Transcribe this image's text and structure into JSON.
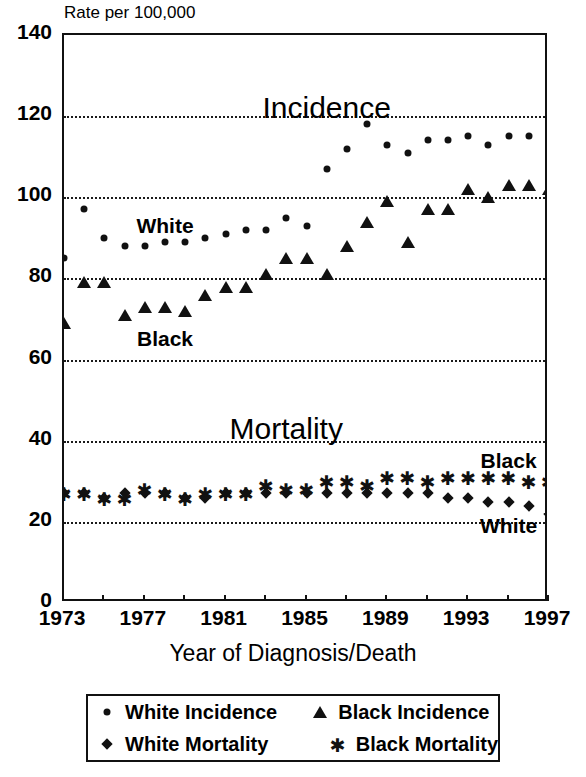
{
  "chart_data": {
    "type": "scatter",
    "title": "",
    "ylabel": "Rate per 100,000",
    "xlabel": "Year of Diagnosis/Death",
    "ylim": [
      0,
      140
    ],
    "xlim": [
      1973,
      1997
    ],
    "ytick_step": 20,
    "xtick_step": 4,
    "grid": true,
    "grid_axis": "y",
    "yticks": [
      "0",
      "20",
      "40",
      "60",
      "80",
      "100",
      "120",
      "140"
    ],
    "xticks": [
      "1973",
      "1977",
      "1981",
      "1985",
      "1989",
      "1993",
      "1997"
    ],
    "x": [
      1973,
      1974,
      1975,
      1976,
      1977,
      1978,
      1979,
      1980,
      1981,
      1982,
      1983,
      1984,
      1985,
      1986,
      1987,
      1988,
      1989,
      1990,
      1991,
      1992,
      1993,
      1994,
      1995,
      1996,
      1997
    ],
    "series": [
      {
        "name": "White Incidence",
        "marker": "dot",
        "values": [
          85,
          97,
          90,
          88,
          88,
          89,
          89,
          90,
          91,
          92,
          92,
          95,
          93,
          107,
          112,
          118,
          113,
          111,
          114,
          114,
          115,
          113,
          115,
          115,
          118
        ]
      },
      {
        "name": "Black Incidence",
        "marker": "triangle",
        "values": [
          69,
          79,
          79,
          71,
          73,
          73,
          72,
          76,
          78,
          78,
          81,
          85,
          85,
          81,
          88,
          94,
          99,
          89,
          97,
          97,
          102,
          100,
          103,
          103,
          102
        ]
      },
      {
        "name": "White Mortality",
        "marker": "diamond",
        "values": [
          27,
          27,
          26,
          27,
          27,
          27,
          26,
          26,
          27,
          27,
          27,
          27,
          27,
          27,
          27,
          27,
          27,
          27,
          27,
          26,
          26,
          25,
          25,
          24,
          22
        ]
      },
      {
        "name": "Black Mortality",
        "marker": "asterisk",
        "values": [
          27,
          27,
          26,
          26,
          28,
          27,
          26,
          27,
          27,
          27,
          29,
          28,
          28,
          30,
          30,
          29,
          31,
          31,
          30,
          31,
          31,
          31,
          31,
          30,
          30
        ]
      }
    ],
    "annotations": [
      {
        "text": "Incidence",
        "x": 1986,
        "y": 122,
        "size": "big"
      },
      {
        "text": "Mortality",
        "x": 1984,
        "y": 43,
        "size": "big"
      },
      {
        "text": "White",
        "x": 1978,
        "y": 93,
        "size": "med"
      },
      {
        "text": "Black",
        "x": 1978,
        "y": 65,
        "size": "med"
      },
      {
        "text": "Black",
        "x": 1995,
        "y": 35,
        "size": "med"
      },
      {
        "text": "White",
        "x": 1995,
        "y": 19,
        "size": "med"
      }
    ]
  },
  "legend": {
    "position": "below-plot",
    "entries": [
      {
        "marker": "dot",
        "label": "White Incidence"
      },
      {
        "marker": "triangle",
        "label": "Black Incidence"
      },
      {
        "marker": "diamond",
        "label": "White Mortality"
      },
      {
        "marker": "asterisk",
        "label": "Black Mortality"
      }
    ]
  },
  "colors": {
    "ink": "#111111",
    "background": "#ffffff"
  },
  "glyphs": {
    "asterisk": "✱"
  }
}
